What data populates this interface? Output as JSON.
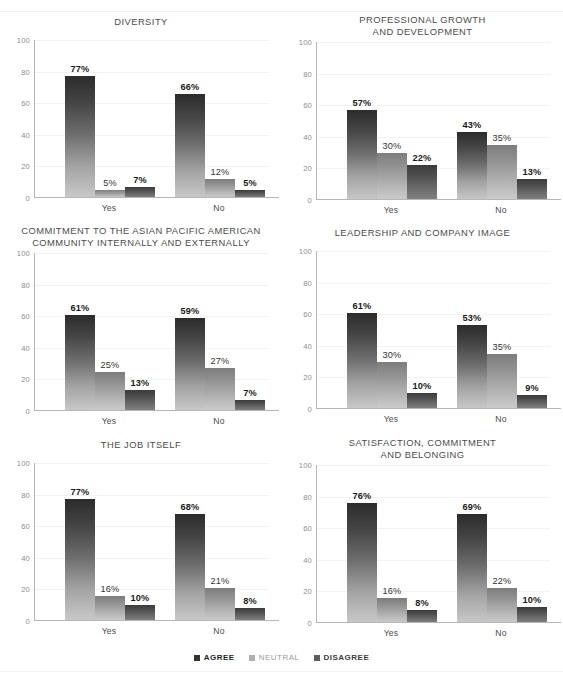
{
  "header": {
    "clipped_text": ""
  },
  "axis": {
    "y_ticks": [
      "100",
      "80",
      "60",
      "40",
      "20",
      "0"
    ],
    "y_min": 0,
    "y_max": 100,
    "categories": [
      "Yes",
      "No"
    ]
  },
  "legend": {
    "items": [
      {
        "label": "AGREE",
        "color": "#333333",
        "key": "agree"
      },
      {
        "label": "NEUTRAL",
        "color": "#b0b0b0",
        "key": "neutral"
      },
      {
        "label": "DISAGREE",
        "color": "#5e5e5e",
        "key": "disagree"
      }
    ]
  },
  "chart_data": [
    {
      "type": "bar",
      "title": "DIVERSITY",
      "xlabel": "",
      "ylabel": "",
      "ylim": [
        0,
        100
      ],
      "grid": true,
      "legend_position": "bottom",
      "categories": [
        "Yes",
        "No"
      ],
      "series": [
        {
          "name": "AGREE",
          "values": [
            77,
            66
          ],
          "labels": [
            "77%",
            "66%"
          ]
        },
        {
          "name": "NEUTRAL",
          "values": [
            5,
            12
          ],
          "labels": [
            "5%",
            "12%"
          ]
        },
        {
          "name": "DISAGREE",
          "values": [
            7,
            5
          ],
          "labels": [
            "7%",
            "5%"
          ]
        }
      ]
    },
    {
      "type": "bar",
      "title": "PROFESSIONAL GROWTH\nAND DEVELOPMENT",
      "xlabel": "",
      "ylabel": "",
      "ylim": [
        0,
        100
      ],
      "grid": true,
      "legend_position": "bottom",
      "categories": [
        "Yes",
        "No"
      ],
      "series": [
        {
          "name": "AGREE",
          "values": [
            57,
            43
          ],
          "labels": [
            "57%",
            "43%"
          ]
        },
        {
          "name": "NEUTRAL",
          "values": [
            30,
            35
          ],
          "labels": [
            "30%",
            "35%"
          ]
        },
        {
          "name": "DISAGREE",
          "values": [
            22,
            13
          ],
          "labels": [
            "22%",
            "13%"
          ]
        }
      ]
    },
    {
      "type": "bar",
      "title": "COMMITMENT TO THE ASIAN PACIFIC AMERICAN\nCOMMUNITY INTERNALLY AND EXTERNALLY",
      "xlabel": "",
      "ylabel": "",
      "ylim": [
        0,
        100
      ],
      "grid": true,
      "legend_position": "bottom",
      "categories": [
        "Yes",
        "No"
      ],
      "series": [
        {
          "name": "AGREE",
          "values": [
            61,
            59
          ],
          "labels": [
            "61%",
            "59%"
          ]
        },
        {
          "name": "NEUTRAL",
          "values": [
            25,
            27
          ],
          "labels": [
            "25%",
            "27%"
          ]
        },
        {
          "name": "DISAGREE",
          "values": [
            13,
            7
          ],
          "labels": [
            "13%",
            "7%"
          ]
        }
      ]
    },
    {
      "type": "bar",
      "title": "LEADERSHIP AND COMPANY IMAGE",
      "xlabel": "",
      "ylabel": "",
      "ylim": [
        0,
        100
      ],
      "grid": true,
      "legend_position": "bottom",
      "categories": [
        "Yes",
        "No"
      ],
      "series": [
        {
          "name": "AGREE",
          "values": [
            61,
            53
          ],
          "labels": [
            "61%",
            "53%"
          ]
        },
        {
          "name": "NEUTRAL",
          "values": [
            30,
            35
          ],
          "labels": [
            "30%",
            "35%"
          ]
        },
        {
          "name": "DISAGREE",
          "values": [
            10,
            9
          ],
          "labels": [
            "10%",
            "9%"
          ]
        }
      ]
    },
    {
      "type": "bar",
      "title": "THE JOB ITSELF",
      "xlabel": "",
      "ylabel": "",
      "ylim": [
        0,
        100
      ],
      "grid": true,
      "legend_position": "bottom",
      "categories": [
        "Yes",
        "No"
      ],
      "series": [
        {
          "name": "AGREE",
          "values": [
            77,
            68
          ],
          "labels": [
            "77%",
            "68%"
          ]
        },
        {
          "name": "NEUTRAL",
          "values": [
            16,
            21
          ],
          "labels": [
            "16%",
            "21%"
          ]
        },
        {
          "name": "DISAGREE",
          "values": [
            10,
            8
          ],
          "labels": [
            "10%",
            "8%"
          ]
        }
      ]
    },
    {
      "type": "bar",
      "title": "SATISFACTION, COMMITMENT\nAND BELONGING",
      "xlabel": "",
      "ylabel": "",
      "ylim": [
        0,
        100
      ],
      "grid": true,
      "legend_position": "bottom",
      "categories": [
        "Yes",
        "No"
      ],
      "series": [
        {
          "name": "AGREE",
          "values": [
            76,
            69
          ],
          "labels": [
            "76%",
            "69%"
          ]
        },
        {
          "name": "NEUTRAL",
          "values": [
            16,
            22
          ],
          "labels": [
            "16%",
            "22%"
          ]
        },
        {
          "name": "DISAGREE",
          "values": [
            8,
            10
          ],
          "labels": [
            "8%",
            "10%"
          ]
        }
      ]
    }
  ]
}
